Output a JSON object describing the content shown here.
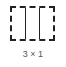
{
  "layout_option": {
    "label": "3 × 1",
    "columns": 3,
    "rows": 1
  }
}
